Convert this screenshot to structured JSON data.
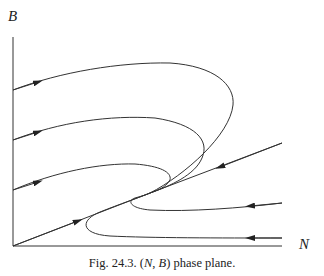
{
  "figure": {
    "y_axis_label": "B",
    "x_axis_label": "N",
    "caption_prefix": "Fig. 24.3. (",
    "caption_var1": "N",
    "caption_sep": ", ",
    "caption_var2": "B",
    "caption_suffix": ") phase plane.",
    "caption_full": "Fig. 24.3. (N, B) phase plane.",
    "line_color": "#333333"
  },
  "diagram": {
    "type": "phase-plane",
    "axes": {
      "x": "N",
      "y": "B"
    },
    "trajectories": [
      {
        "id": "top-loop",
        "start": "left axis high",
        "direction": "rightward then loops back to node"
      },
      {
        "id": "middle-loop",
        "start": "left axis middle",
        "direction": "rightward then loops back to node"
      },
      {
        "id": "lower-loop",
        "start": "left axis lower",
        "direction": "rightward then curves into node"
      },
      {
        "id": "separatrix-left",
        "start": "origin",
        "direction": "toward node"
      },
      {
        "id": "separatrix-right",
        "start": "upper right",
        "direction": "toward node"
      },
      {
        "id": "bottom-right-upper",
        "start": "right",
        "direction": "leftward then loops into node"
      },
      {
        "id": "bottom-right-lower",
        "start": "right",
        "direction": "leftward then loops into node"
      }
    ]
  }
}
